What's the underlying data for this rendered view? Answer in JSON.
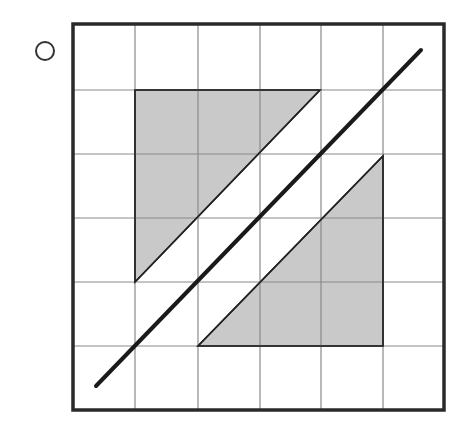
{
  "figure": {
    "option_marker": "circle",
    "grid": {
      "rows": 6,
      "cols": 6,
      "x_lines": [
        73,
        135,
        198,
        260,
        321,
        383,
        444
      ],
      "y_lines": [
        24,
        90,
        154,
        218,
        282,
        346,
        410
      ]
    },
    "shaded_regions": [
      {
        "name": "upper-left-triangle",
        "points": "135,90 320,90 135,282"
      },
      {
        "name": "lower-right-triangle",
        "points": "383,156 383,346 198,346"
      }
    ],
    "diagonal_line": {
      "x1": 96,
      "y1": 386,
      "x2": 421,
      "y2": 50
    },
    "colors": {
      "shade": "#c9c9c9",
      "stroke": "#222222",
      "grid": "#8a8a8a",
      "border": "#2a2a2a"
    }
  }
}
